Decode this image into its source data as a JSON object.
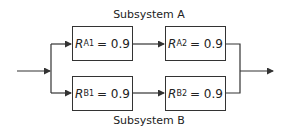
{
  "diagram": {
    "subsystem_a": {
      "title": "Subsystem A",
      "blocks": [
        {
          "symbol": "R",
          "subscript": "A1",
          "equals": "= 0.9"
        },
        {
          "symbol": "R",
          "subscript": "A2",
          "equals": "= 0.9"
        }
      ]
    },
    "subsystem_b": {
      "title": "Subsystem B",
      "blocks": [
        {
          "symbol": "R",
          "subscript": "B1",
          "equals": "= 0.9"
        },
        {
          "symbol": "R",
          "subscript": "B2",
          "equals": "= 0.9"
        }
      ]
    },
    "colors": {
      "line": "#333333",
      "text": "#222222",
      "background": "#ffffff"
    }
  }
}
